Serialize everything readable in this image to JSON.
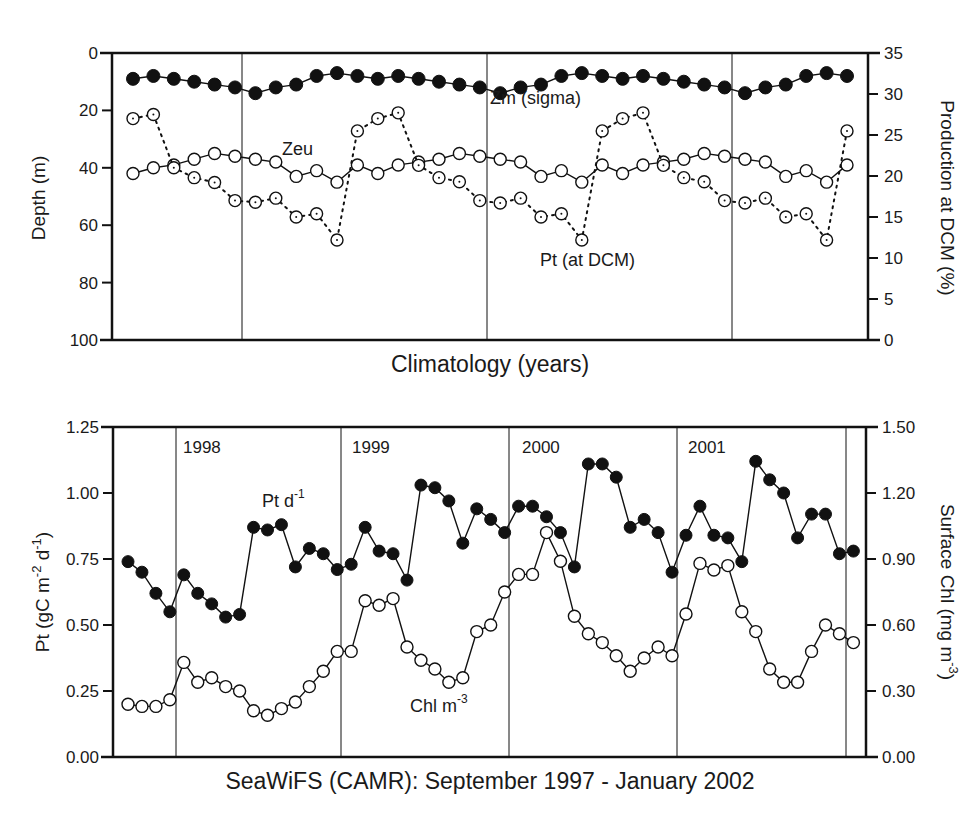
{
  "chart_data": [
    {
      "type": "line",
      "panel": "top",
      "title": "",
      "xlabel": "Climatology (years)",
      "ylabel": "Depth (m)",
      "ylabel_right": "Production  at DCM (%)",
      "ylim": [
        100,
        0
      ],
      "ylim_right": [
        0,
        35
      ],
      "yticks": [
        "0",
        "20",
        "40",
        "60",
        "80",
        "100"
      ],
      "yticks_right": [
        "0",
        "5",
        "10",
        "15",
        "20",
        "25",
        "30",
        "35"
      ],
      "grid": false,
      "year_dividers": 3,
      "x": [
        1,
        2,
        3,
        4,
        5,
        6,
        7,
        8,
        9,
        10,
        11,
        12,
        13,
        14,
        15,
        16,
        17,
        18,
        19,
        20,
        21,
        22,
        23,
        24,
        25,
        26,
        27,
        28,
        29,
        30,
        31,
        32,
        33,
        34,
        35,
        36
      ],
      "series": [
        {
          "name": "Zm (sigma)",
          "axis": "left",
          "marker": "filled-circle",
          "line": "solid",
          "values": [
            9,
            8,
            9,
            10,
            11,
            12,
            14,
            12,
            11,
            8,
            7,
            8,
            9,
            8,
            9,
            10,
            11,
            12,
            14,
            12,
            11,
            8,
            7,
            8,
            9,
            8,
            9,
            10,
            11,
            12,
            14,
            12,
            11,
            8,
            7,
            8
          ]
        },
        {
          "name": "Zeu",
          "axis": "left",
          "marker": "open-circle",
          "line": "solid",
          "values": [
            42,
            40,
            39,
            37,
            35,
            36,
            37,
            38,
            43,
            41,
            45,
            39,
            42,
            39,
            38,
            37,
            35,
            36,
            37,
            38,
            43,
            41,
            45,
            39,
            42,
            39,
            38,
            37,
            35,
            36,
            37,
            38,
            43,
            41,
            45,
            39
          ]
        },
        {
          "name": "Pt  (at DCM)",
          "axis": "right",
          "marker": "open-circle-dot",
          "line": "dotted",
          "values": [
            27.0,
            27.5,
            21.0,
            19.8,
            19.2,
            17.0,
            16.8,
            17.3,
            15.0,
            15.4,
            12.2,
            25.5,
            27.0,
            27.7,
            21.3,
            19.8,
            19.3,
            17.0,
            16.7,
            17.3,
            15.0,
            15.4,
            12.2,
            25.5,
            27.0,
            27.7,
            21.3,
            19.8,
            19.3,
            17.0,
            16.7,
            17.3,
            15.0,
            15.4,
            12.2,
            25.5
          ]
        }
      ],
      "annotations": [
        "Zm (sigma)",
        "Zeu",
        "Pt  (at DCM)"
      ]
    },
    {
      "type": "line",
      "panel": "bottom",
      "title": "",
      "xlabel": "SeaWiFS (CAMR): September 1997 - January 2002",
      "ylabel": "Pt (gC  m-2 d-1)",
      "ylabel_right": "Surface Chl (mg m-3)",
      "ylim": [
        0,
        1.25
      ],
      "ylim_right": [
        0,
        1.5
      ],
      "yticks": [
        "0.00",
        "0.25",
        "0.50",
        "0.75",
        "1.00",
        "1.25"
      ],
      "yticks_right": [
        "0.00",
        "0.30",
        "0.60",
        "0.90",
        "1.20",
        "1.50"
      ],
      "grid": false,
      "year_labels": [
        "1998",
        "1999",
        "2000",
        "2001"
      ],
      "series": [
        {
          "name": "Pt d-1",
          "axis": "left",
          "marker": "filled-circle",
          "line": "solid",
          "values": [
            0.74,
            0.7,
            0.62,
            0.55,
            0.69,
            0.62,
            0.58,
            0.53,
            0.54,
            0.87,
            0.86,
            0.88,
            0.72,
            0.79,
            0.77,
            0.71,
            0.73,
            0.87,
            0.78,
            0.77,
            0.67,
            1.03,
            1.02,
            0.97,
            0.81,
            0.94,
            0.9,
            0.85,
            0.95,
            0.95,
            0.91,
            0.85,
            0.72,
            1.11,
            1.11,
            1.06,
            0.87,
            0.9,
            0.85,
            0.7,
            0.84,
            0.95,
            0.84,
            0.83,
            0.74,
            1.12,
            1.05,
            1.0,
            0.83,
            0.92,
            0.92,
            0.77,
            0.78
          ]
        },
        {
          "name": "Chl m-3",
          "axis": "right",
          "marker": "open-circle",
          "line": "solid",
          "values": [
            0.24,
            0.23,
            0.23,
            0.26,
            0.43,
            0.34,
            0.36,
            0.32,
            0.3,
            0.21,
            0.19,
            0.22,
            0.25,
            0.32,
            0.39,
            0.48,
            0.48,
            0.71,
            0.69,
            0.72,
            0.5,
            0.44,
            0.4,
            0.34,
            0.36,
            0.57,
            0.6,
            0.75,
            0.83,
            0.83,
            1.02,
            0.89,
            0.64,
            0.56,
            0.52,
            0.46,
            0.39,
            0.45,
            0.5,
            0.46,
            0.65,
            0.88,
            0.85,
            0.87,
            0.66,
            0.57,
            0.4,
            0.34,
            0.34,
            0.48,
            0.6,
            0.56,
            0.52
          ]
        }
      ],
      "annotations": [
        "Pt d-1",
        "Chl m-3"
      ]
    }
  ],
  "top": {
    "ylabel": "Depth (m)",
    "ylabel_right": "Production  at DCM (%)",
    "xlabel": "Climatology (years)",
    "label_zm": "Zm (sigma)",
    "label_zeu": "Zeu",
    "label_pt": "Pt  (at DCM)"
  },
  "bottom": {
    "ylabel_main": "Pt (gC  m",
    "ylabel_sup1": "-2",
    "ylabel_mid": " d",
    "ylabel_sup2": "-1",
    "ylabel_end": ")",
    "ylabel_right_main": "Surface Chl (mg m",
    "ylabel_right_sup": "-3",
    "ylabel_right_end": ")",
    "xlabel": "SeaWiFS (CAMR): September 1997 - January 2002",
    "label_pt_main": "Pt d",
    "label_pt_sup": "-1",
    "label_chl_main": "Chl m",
    "label_chl_sup": "-3",
    "years": [
      "1998",
      "1999",
      "2000",
      "2001"
    ]
  }
}
